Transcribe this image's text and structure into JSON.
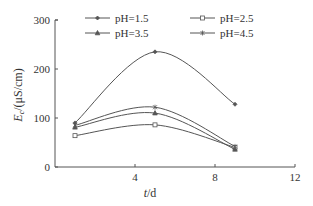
{
  "chart_data": {
    "type": "line",
    "title": "",
    "xlabel": "t/d",
    "xlabel_main": "t",
    "xlabel_unit": "/d",
    "ylabel": "Ec/(μS/cm)",
    "ylabel_main": "E",
    "ylabel_sub": "c",
    "ylabel_unit": "/(μS/cm)",
    "xlim": [
      0,
      12
    ],
    "ylim": [
      0,
      300
    ],
    "x_ticks": [
      4,
      8,
      12
    ],
    "y_ticks": [
      0,
      100,
      200,
      300
    ],
    "x_tick_labels": [
      "4",
      "8",
      "12"
    ],
    "y_tick_labels": [
      "0",
      "100",
      "200",
      "300"
    ],
    "grid": false,
    "legend_position": "top-inside",
    "x": [
      1,
      5,
      9
    ],
    "series": [
      {
        "name": "pH=1.5",
        "marker": "diamond",
        "values": [
          90,
          235,
          128
        ]
      },
      {
        "name": "pH=2.5",
        "marker": "square",
        "values": [
          64,
          86,
          40
        ]
      },
      {
        "name": "pH=3.5",
        "marker": "triangle",
        "values": [
          81,
          110,
          36
        ]
      },
      {
        "name": "pH=4.5",
        "marker": "asterisk",
        "values": [
          85,
          122,
          42
        ]
      }
    ]
  },
  "colors": {
    "line": "#555555",
    "axis": "#555555",
    "text": "#333333"
  }
}
